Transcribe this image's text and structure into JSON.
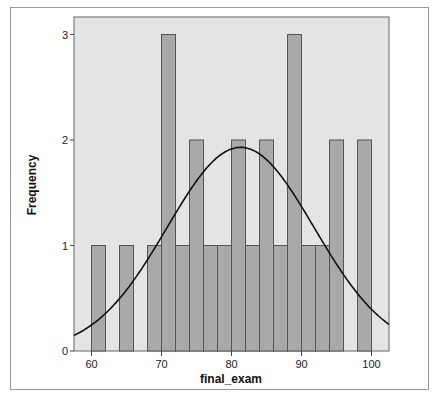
{
  "chart_data": {
    "type": "bar",
    "subtype": "histogram",
    "title": "",
    "xlabel": "final_exam",
    "ylabel": "Frequency",
    "bin_width": 2,
    "bins": [
      {
        "start": 60,
        "end": 62,
        "count": 1
      },
      {
        "start": 62,
        "end": 64,
        "count": 0
      },
      {
        "start": 64,
        "end": 66,
        "count": 1
      },
      {
        "start": 66,
        "end": 68,
        "count": 0
      },
      {
        "start": 68,
        "end": 70,
        "count": 1
      },
      {
        "start": 70,
        "end": 72,
        "count": 3
      },
      {
        "start": 72,
        "end": 74,
        "count": 1
      },
      {
        "start": 74,
        "end": 76,
        "count": 2
      },
      {
        "start": 76,
        "end": 78,
        "count": 1
      },
      {
        "start": 78,
        "end": 80,
        "count": 1
      },
      {
        "start": 80,
        "end": 82,
        "count": 2
      },
      {
        "start": 82,
        "end": 84,
        "count": 1
      },
      {
        "start": 84,
        "end": 86,
        "count": 2
      },
      {
        "start": 86,
        "end": 88,
        "count": 1
      },
      {
        "start": 88,
        "end": 90,
        "count": 3
      },
      {
        "start": 90,
        "end": 92,
        "count": 1
      },
      {
        "start": 92,
        "end": 94,
        "count": 1
      },
      {
        "start": 94,
        "end": 96,
        "count": 2
      },
      {
        "start": 96,
        "end": 98,
        "count": 0
      },
      {
        "start": 98,
        "end": 100,
        "count": 2
      }
    ],
    "x_ticks": [
      60,
      70,
      80,
      90,
      100
    ],
    "y_ticks": [
      0,
      1,
      2,
      3
    ],
    "xlim": [
      57.5,
      102.5
    ],
    "ylim": [
      0,
      3.1
    ],
    "normal_curve": {
      "mean": 81.3,
      "peak": 1.93,
      "sd": 10.5
    },
    "grid": false,
    "legend": null,
    "colors": {
      "bar_fill": "#a9a9a9",
      "bar_stroke": "#555555",
      "plot_bg": "#e4e4e4",
      "curve": "#111111"
    }
  }
}
